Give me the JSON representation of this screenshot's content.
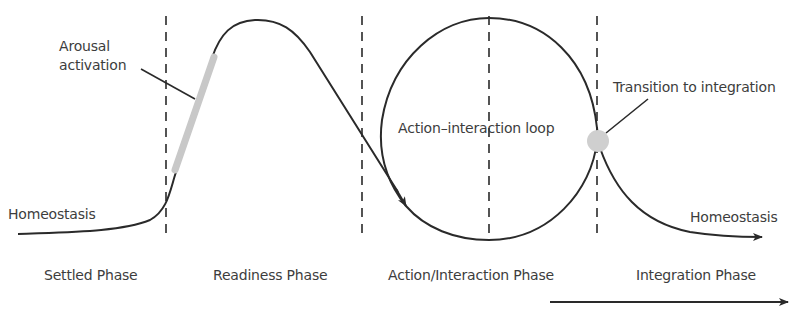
{
  "diagram": {
    "type": "phase-process-diagram",
    "annotations": {
      "arousal": "Arousal\nactivation",
      "arousal_line1": "Arousal",
      "arousal_line2": "activation",
      "loop": "Action–interaction loop",
      "transition": "Transition to integration",
      "homeostasis_start": "Homeostasis",
      "homeostasis_end": "Homeostasis"
    },
    "phases": [
      {
        "label": "Settled Phase"
      },
      {
        "label": "Readiness Phase"
      },
      {
        "label": "Action/Interaction Phase"
      },
      {
        "label": "Integration Phase"
      }
    ],
    "colors": {
      "line": "#2a2a2a",
      "highlight": "#c8c8c8",
      "text": "#3d3d3d"
    }
  }
}
